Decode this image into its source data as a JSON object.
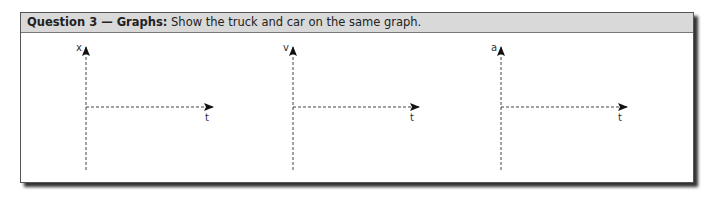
{
  "question": {
    "title_bold": "Question 3 — Graphs:",
    "title_text": " Show the truck and car on the same graph."
  },
  "graphs": [
    {
      "y_label": "x",
      "x_label": "t"
    },
    {
      "y_label": "v",
      "x_label": "t"
    },
    {
      "y_label": "a",
      "x_label": "t"
    }
  ]
}
